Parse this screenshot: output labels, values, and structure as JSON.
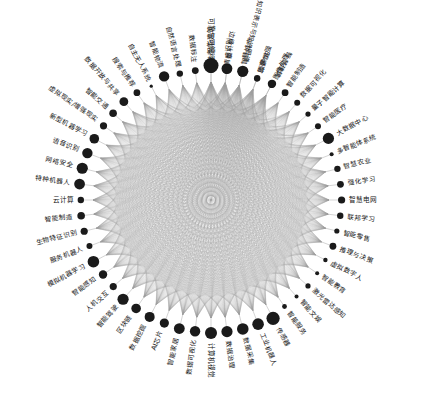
{
  "figure": {
    "title": "",
    "type": "circular-network-graph",
    "node_count": 52,
    "background_color": "#ffffff",
    "node_color": "#1a1a1a",
    "edge_color": "#9a9a9a"
  },
  "chart_data": {
    "type": "network",
    "layout": "circular",
    "title": "",
    "xlabel": "",
    "ylabel": "",
    "legend": [],
    "grid": false,
    "center": [
      211,
      200
    ],
    "radius": 118,
    "node_color": "#1a1a1a",
    "edge_color": "#9a9a9a",
    "edge_opacity": 0.3,
    "edge_style": "curved-bundled",
    "nodes": [
      {
        "id": 0,
        "label": "智能建筑",
        "angle": -90,
        "size": 7.5
      },
      {
        "id": 1,
        "label": "情感识别",
        "angle": -83.08,
        "size": 2.2
      },
      {
        "id": 2,
        "label": "智慧城市",
        "angle": -76.15,
        "size": 4.0
      },
      {
        "id": 3,
        "label": "图像增强",
        "angle": -69.23,
        "size": 3.2
      },
      {
        "id": 4,
        "label": "图像处理",
        "angle": -62.31,
        "size": 3.0
      },
      {
        "id": 5,
        "label": "智能制造",
        "angle": -55.38,
        "size": 3.4
      },
      {
        "id": 6,
        "label": "数据可视化",
        "angle": -48.46,
        "size": 3.0
      },
      {
        "id": 7,
        "label": "量子智能计算",
        "angle": -41.54,
        "size": 2.6
      },
      {
        "id": 8,
        "label": "智能医疗",
        "angle": -34.62,
        "size": 3.0
      },
      {
        "id": 9,
        "label": "大数据中心",
        "angle": -27.69,
        "size": 5.6
      },
      {
        "id": 10,
        "label": "多智能体系统",
        "angle": -20.77,
        "size": 2.0
      },
      {
        "id": 11,
        "label": "智慧农业",
        "angle": -13.85,
        "size": 3.2
      },
      {
        "id": 12,
        "label": "强化学习",
        "angle": -6.92,
        "size": 3.4
      },
      {
        "id": 13,
        "label": "智慧电网",
        "angle": 0,
        "size": 3.6
      },
      {
        "id": 14,
        "label": "联邦学习",
        "angle": 6.92,
        "size": 3.2
      },
      {
        "id": 15,
        "label": "智能零售",
        "angle": 13.85,
        "size": 2.6
      },
      {
        "id": 16,
        "label": "推理与决策",
        "angle": 20.77,
        "size": 3.4
      },
      {
        "id": 17,
        "label": "虚拟数字人",
        "angle": 27.69,
        "size": 2.2
      },
      {
        "id": 18,
        "label": "智能教育",
        "angle": 34.62,
        "size": 2.0
      },
      {
        "id": 19,
        "label": "激光雷达感知",
        "angle": 41.54,
        "size": 2.6
      },
      {
        "id": 20,
        "label": "智能文娱",
        "angle": 48.46,
        "size": 2.0
      },
      {
        "id": 21,
        "label": "智能服务",
        "angle": 55.38,
        "size": 2.4
      },
      {
        "id": 22,
        "label": "传感器",
        "angle": 62.31,
        "size": 6.6
      },
      {
        "id": 23,
        "label": "工业机器人",
        "angle": 69.23,
        "size": 5.8
      },
      {
        "id": 24,
        "label": "数据采集",
        "angle": 76.15,
        "size": 5.8
      },
      {
        "id": 25,
        "label": "数据治理",
        "angle": 83.08,
        "size": 5.6
      },
      {
        "id": 26,
        "label": "计算机视觉",
        "angle": 90,
        "size": 6.0
      },
      {
        "id": 27,
        "label": "数据可视化",
        "angle": 96.92,
        "size": 5.2
      },
      {
        "id": 28,
        "label": "智能家居",
        "angle": 103.85,
        "size": 5.4
      },
      {
        "id": 29,
        "label": "AI芯片",
        "angle": 110.77,
        "size": 4.6
      },
      {
        "id": 30,
        "label": "数据挖掘",
        "angle": 117.69,
        "size": 5.0
      },
      {
        "id": 31,
        "label": "区块链",
        "angle": 124.62,
        "size": 4.8
      },
      {
        "id": 32,
        "label": "智能驾驶",
        "angle": 131.54,
        "size": 5.6
      },
      {
        "id": 33,
        "label": "人机交互",
        "angle": 138.46,
        "size": 3.6
      },
      {
        "id": 34,
        "label": "智能感知",
        "angle": 145.38,
        "size": 4.2
      },
      {
        "id": 35,
        "label": "模拟机器学习",
        "angle": 152.31,
        "size": 5.8
      },
      {
        "id": 36,
        "label": "服务机器人",
        "angle": 159.23,
        "size": 3.0
      },
      {
        "id": 37,
        "label": "生物特征识别",
        "angle": 166.15,
        "size": 3.6
      },
      {
        "id": 38,
        "label": "智能制造",
        "angle": 173.08,
        "size": 3.8
      },
      {
        "id": 39,
        "label": "云计算",
        "angle": 180,
        "size": 3.2
      },
      {
        "id": 40,
        "label": "特种机器人",
        "angle": 186.92,
        "size": 5.4
      },
      {
        "id": 41,
        "label": "网络安全",
        "angle": 193.85,
        "size": 5.6
      },
      {
        "id": 42,
        "label": "语音识别",
        "angle": 200.77,
        "size": 5.2
      },
      {
        "id": 43,
        "label": "新型机器学习",
        "angle": 207.69,
        "size": 4.8
      },
      {
        "id": 44,
        "label": "虚拟现实/增强现实",
        "angle": 214.62,
        "size": 3.6
      },
      {
        "id": 45,
        "label": "智能交通",
        "angle": 221.54,
        "size": 3.8
      },
      {
        "id": 46,
        "label": "数据开放与共享",
        "angle": 228.46,
        "size": 4.4
      },
      {
        "id": 47,
        "label": "搜索与推荐",
        "angle": 235.38,
        "size": 3.4
      },
      {
        "id": 48,
        "label": "自主无人系统",
        "angle": 242.31,
        "size": 1.6
      },
      {
        "id": 49,
        "label": "智能物流",
        "angle": 249.23,
        "size": 5.2
      },
      {
        "id": 50,
        "label": "自然语言处理",
        "angle": 256.15,
        "size": 3.2
      },
      {
        "id": 51,
        "label": "数据标注",
        "angle": 263.08,
        "size": 3.4
      },
      {
        "id": 52,
        "label": "可靠与可解释",
        "angle": 270,
        "size": 4.6
      },
      {
        "id": 53,
        "label": "边缘计算",
        "angle": 276.92,
        "size": 5.4
      },
      {
        "id": 54,
        "label": "知识表示与知识图谱",
        "angle": 283.85,
        "size": 5.6
      },
      {
        "id": 55,
        "label": "5G通信",
        "angle": 290.77,
        "size": 2.6
      },
      {
        "id": 56,
        "label": "智慧建筑",
        "angle": 297.69,
        "size": 4.2
      }
    ]
  }
}
